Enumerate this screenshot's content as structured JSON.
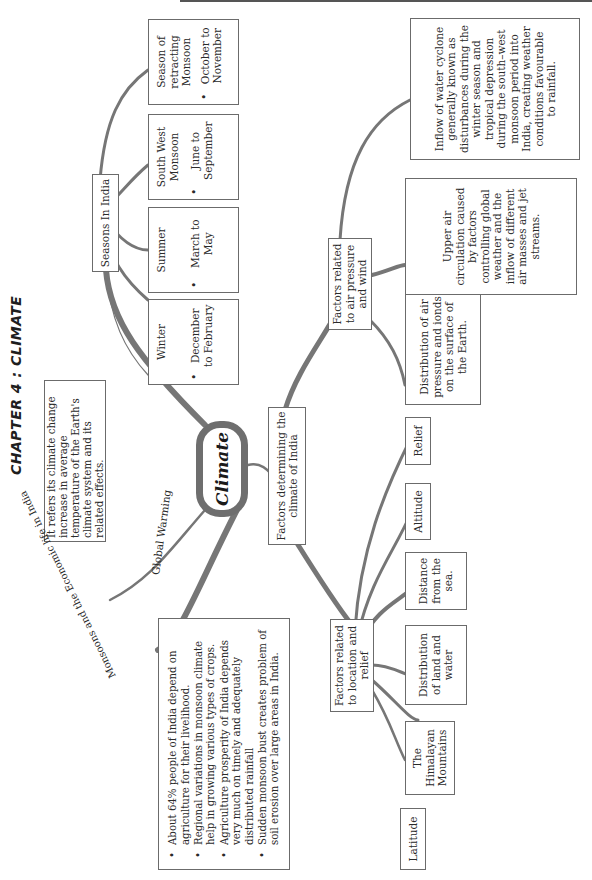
{
  "page": {
    "title": "CHAPTER 4 : CLIMATE",
    "orientation": "rotated-90-ccw"
  },
  "central_node": {
    "label": "Climate"
  },
  "global_warming": {
    "edge_label": "Global Warming",
    "text": "It refers its climate change increase in average temperature of the Earth's climate system and its related effects."
  },
  "seasons": {
    "label": "Seasons In India",
    "items": [
      {
        "name": "Winter",
        "range": "December to February"
      },
      {
        "name": "Summer",
        "range": "March to May"
      },
      {
        "name": "South West Monsoon",
        "range": "June to September"
      },
      {
        "name": "Season of retracting Monsoon",
        "range": "October to November"
      }
    ]
  },
  "monsoon_economy": {
    "edge_label": "Monsoons and the Economic life in India",
    "points": [
      "About 64% people of India depend on agriculture for their livelihood.",
      "Regional variations in monsoon climate help in growing various types of crops.",
      "Agriculture prosperity of India depends very much on timely and adequately distributed rainfall",
      "Sudden monsoon bust creates problem of soil erosion over large areas in India."
    ]
  },
  "factors": {
    "label": "Factors determining the climate of India",
    "location_relief": {
      "label": "Factors related to location and relief",
      "items": [
        "Latitude",
        "The Himalayan Mountains",
        "Distribution of land and water",
        "Distance from the sea.",
        "Altitude",
        "Relief"
      ]
    },
    "air_pressure_wind": {
      "label": "Factors related to air pressure and wind",
      "items": [
        "Distribution of air pressure and ionds on the surface of the Earth.",
        "Upper air circulation caused by factors controlling global weather and the inflow of different air masses and jet streams.",
        "Inflow of water cyclone generally known as disturbances during the winter season and tropical depression during the south–west monsoon period into India, creating weather conditions favourable to rainfall."
      ]
    }
  },
  "colors": {
    "branch": "#767676",
    "box_border": "#6b6b6b",
    "text": "#2a2a2a",
    "background": "#ffffff"
  }
}
